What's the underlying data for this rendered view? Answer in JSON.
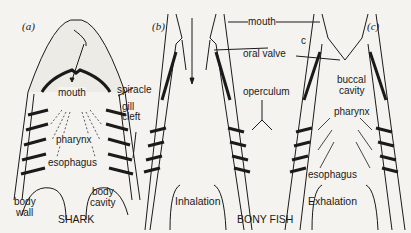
{
  "figure": {
    "panels": [
      {
        "id": "a",
        "label": "(a)",
        "caption": "SHARK"
      },
      {
        "id": "b",
        "label": "(b)",
        "caption": "Inhalation"
      },
      {
        "id": "c",
        "label": "(c)",
        "caption": "Exhalation"
      }
    ],
    "group_caption": "BONY FISH",
    "shark_labels": {
      "mouth": "mouth",
      "spiracle": "spiracle",
      "gill_cleft_1": "gill",
      "gill_cleft_2": "cleft",
      "pharynx": "pharynx",
      "esophagus": "esophagus",
      "body_wall_1": "body",
      "body_wall_2": "wall",
      "body_cavity_1": "body",
      "body_cavity_2": "cavity"
    },
    "fish_labels": {
      "mouth": "mouth",
      "oral_valve": "oral valve",
      "operculum": "operculum",
      "c_marker": "c",
      "buccal_1": "buccal",
      "buccal_2": "cavity",
      "pharynx": "pharynx",
      "esophagus": "esophagus"
    },
    "colors": {
      "ink": "#1a1a1a",
      "background": "#f4f3f0",
      "stipple": "#c8c6c0"
    }
  }
}
